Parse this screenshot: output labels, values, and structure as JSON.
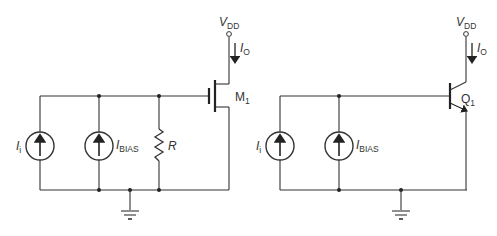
{
  "circuits": [
    {
      "name": "mosfet-current-mirror-input",
      "supply": {
        "symbol": "V",
        "sub": "DD"
      },
      "output_current": {
        "symbol": "I",
        "sub": "O"
      },
      "transistor": {
        "symbol": "M",
        "sub": "1",
        "type": "NMOS"
      },
      "sources": [
        {
          "symbol": "I",
          "sub": "i"
        },
        {
          "symbol": "I",
          "sub": "BIAS"
        }
      ],
      "resistor": {
        "symbol": "R"
      }
    },
    {
      "name": "bjt-current-mirror-input",
      "supply": {
        "symbol": "V",
        "sub": "DD"
      },
      "output_current": {
        "symbol": "I",
        "sub": "O"
      },
      "transistor": {
        "symbol": "Q",
        "sub": "1",
        "type": "NPN"
      },
      "sources": [
        {
          "symbol": "I",
          "sub": "i"
        },
        {
          "symbol": "I",
          "sub": "BIAS"
        }
      ]
    }
  ]
}
